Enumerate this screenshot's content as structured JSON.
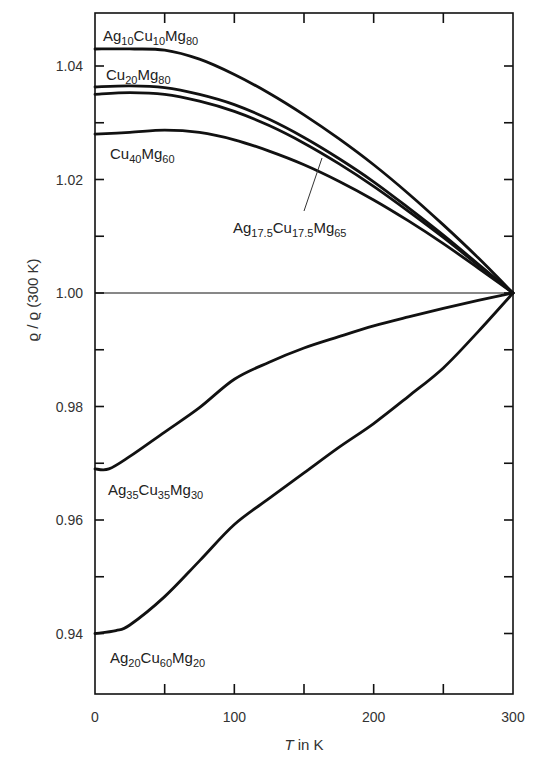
{
  "chart_data": {
    "type": "line",
    "title": "",
    "xlabel": "T in K",
    "ylabel": "ϱ / ϱ (300 K)",
    "xlim": [
      0,
      300
    ],
    "ylim": [
      0.93,
      1.05
    ],
    "grid": false,
    "legend_position": "inline labels",
    "x_ticks": [
      0,
      50,
      100,
      150,
      200,
      250,
      300
    ],
    "x_tick_labels": [
      "0",
      "",
      "100",
      "",
      "200",
      "",
      "300"
    ],
    "y_ticks": [
      0.94,
      0.95,
      0.96,
      0.97,
      0.98,
      0.99,
      1.0,
      1.01,
      1.02,
      1.03,
      1.04
    ],
    "y_tick_labels": [
      "0.94",
      "",
      "0.96",
      "",
      "0.98",
      "",
      "1.00",
      "",
      "1.02",
      "",
      "1.04"
    ],
    "reference_line": {
      "y": 1.0,
      "label": ""
    },
    "series": [
      {
        "name": "Ag10Cu10Mg80",
        "label": {
          "parts": [
            [
              "Ag",
              ""
            ],
            [
              "10",
              "sub"
            ],
            [
              "Cu",
              ""
            ],
            [
              "10",
              "sub"
            ],
            [
              "Mg",
              ""
            ],
            [
              "80",
              "sub"
            ]
          ]
        },
        "x": [
          0,
          25,
          50,
          75,
          100,
          125,
          150,
          175,
          200,
          225,
          250,
          275,
          300
        ],
        "values": [
          1.043,
          1.043,
          1.0428,
          1.0412,
          1.0385,
          1.0352,
          1.0314,
          1.0272,
          1.0226,
          1.0175,
          1.012,
          1.0062,
          1.0
        ]
      },
      {
        "name": "Cu20Mg80",
        "label": {
          "parts": [
            [
              "Cu",
              ""
            ],
            [
              "20",
              "sub"
            ],
            [
              "Mg",
              ""
            ],
            [
              "80",
              "sub"
            ]
          ]
        },
        "x": [
          0,
          25,
          50,
          75,
          100,
          125,
          150,
          175,
          200,
          225,
          250,
          275,
          300
        ],
        "values": [
          1.0363,
          1.0365,
          1.0362,
          1.035,
          1.0332,
          1.0306,
          1.0274,
          1.0237,
          1.0196,
          1.015,
          1.0102,
          1.0051,
          1.0
        ]
      },
      {
        "name": "Ag17.5Cu17.5Mg65",
        "label": {
          "parts": [
            [
              "Ag",
              ""
            ],
            [
              "17.5",
              "sub"
            ],
            [
              "Cu",
              ""
            ],
            [
              "17.5",
              "sub"
            ],
            [
              "Mg",
              ""
            ],
            [
              "65",
              "sub"
            ]
          ]
        },
        "x": [
          0,
          25,
          50,
          75,
          100,
          125,
          150,
          175,
          200,
          225,
          250,
          275,
          300
        ],
        "values": [
          1.035,
          1.0353,
          1.035,
          1.0338,
          1.032,
          1.0295,
          1.0264,
          1.0228,
          1.0188,
          1.0144,
          1.0098,
          1.0049,
          1.0
        ]
      },
      {
        "name": "Cu40Mg60",
        "label": {
          "parts": [
            [
              "Cu",
              ""
            ],
            [
              "40",
              "sub"
            ],
            [
              "Mg",
              ""
            ],
            [
              "60",
              "sub"
            ]
          ]
        },
        "x": [
          0,
          25,
          50,
          75,
          100,
          125,
          150,
          175,
          200,
          225,
          250,
          275,
          300
        ],
        "values": [
          1.028,
          1.0283,
          1.0287,
          1.0283,
          1.027,
          1.025,
          1.0226,
          1.0197,
          1.0164,
          1.0127,
          1.0087,
          1.0044,
          1.0
        ]
      },
      {
        "name": "Ag35Cu35Mg30",
        "label": {
          "parts": [
            [
              "Ag",
              ""
            ],
            [
              "35",
              "sub"
            ],
            [
              "Cu",
              ""
            ],
            [
              "35",
              "sub"
            ],
            [
              "Mg",
              ""
            ],
            [
              "30",
              "sub"
            ]
          ]
        },
        "x": [
          0,
          10,
          25,
          50,
          75,
          100,
          125,
          150,
          175,
          200,
          225,
          250,
          275,
          300
        ],
        "values": [
          0.969,
          0.969,
          0.9712,
          0.9755,
          0.9798,
          0.9848,
          0.9878,
          0.9903,
          0.9923,
          0.9942,
          0.9958,
          0.9973,
          0.9987,
          1.0
        ]
      },
      {
        "name": "Ag20Cu60Mg20",
        "label": {
          "parts": [
            [
              "Ag",
              ""
            ],
            [
              "20",
              "sub"
            ],
            [
              "Cu",
              ""
            ],
            [
              "60",
              "sub"
            ],
            [
              "Mg",
              ""
            ],
            [
              "20",
              "sub"
            ]
          ]
        },
        "x": [
          0,
          15,
          25,
          50,
          75,
          100,
          125,
          150,
          175,
          200,
          225,
          250,
          275,
          300
        ],
        "values": [
          0.94,
          0.9405,
          0.9415,
          0.9465,
          0.9528,
          0.9592,
          0.9638,
          0.9683,
          0.9728,
          0.977,
          0.9818,
          0.9868,
          0.9932,
          1.0
        ]
      }
    ],
    "annotations": [
      {
        "text": "Ag10Cu10Mg80",
        "target": "Ag10Cu10Mg80",
        "position": "above curve, top-left"
      },
      {
        "text": "Cu20Mg80",
        "target": "Cu20Mg80",
        "position": "above curve, left"
      },
      {
        "text": "Cu40Mg60",
        "target": "Cu40Mg60",
        "position": "below curve, left"
      },
      {
        "text": "Ag17.5Cu17.5Mg65",
        "target": "Ag17.5Cu17.5Mg65",
        "position": "leader line to curve near T≈165"
      },
      {
        "text": "Ag35Cu35Mg30",
        "target": "Ag35Cu35Mg30",
        "position": "below curve start"
      },
      {
        "text": "Ag20Cu60Mg20",
        "target": "Ag20Cu60Mg20",
        "position": "below curve start"
      }
    ]
  },
  "axes": {
    "x_title_italic": "T",
    "x_title_rest": " in K",
    "y_title": "ϱ / ϱ (300 K)"
  }
}
